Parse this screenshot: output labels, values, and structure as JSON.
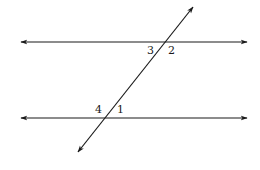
{
  "diagram": {
    "title": "",
    "colors": {
      "stroke": "#1a1a1a",
      "background": "#ffffff"
    },
    "lines": [
      {
        "id": "top-parallel-line",
        "x1": 21,
        "y1": 42,
        "x2": 247,
        "y2": 42,
        "arrows": "both"
      },
      {
        "id": "bottom-parallel-line",
        "x1": 21,
        "y1": 118,
        "x2": 247,
        "y2": 118,
        "arrows": "both"
      },
      {
        "id": "transversal",
        "x1": 78,
        "y1": 152,
        "x2": 193,
        "y2": 7,
        "arrows": "both"
      }
    ],
    "angle_labels": [
      {
        "id": "angle-3",
        "text": "3",
        "x": 147,
        "y": 54
      },
      {
        "id": "angle-2",
        "text": "2",
        "x": 168,
        "y": 54
      },
      {
        "id": "angle-4",
        "text": "4",
        "x": 95,
        "y": 113
      },
      {
        "id": "angle-1",
        "text": "1",
        "x": 117,
        "y": 113
      }
    ]
  }
}
